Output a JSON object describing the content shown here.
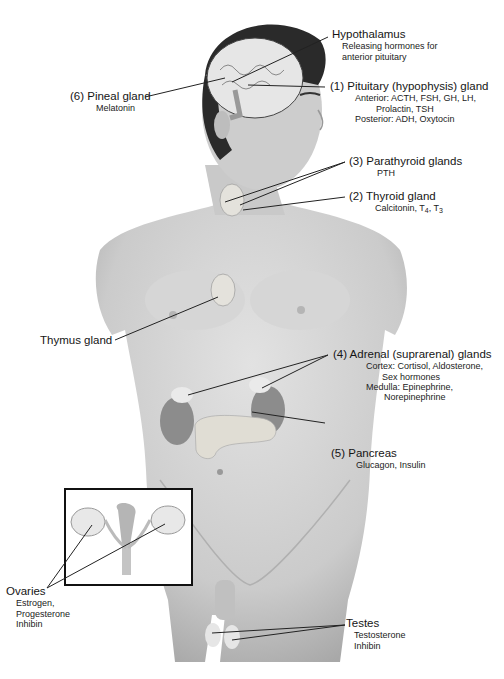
{
  "figure": {
    "labels": {
      "hypothalamus": {
        "name": "Hypothalamus",
        "hormones": [
          "Releasing hormones for",
          "anterior pituitary"
        ]
      },
      "pituitary": {
        "name": "(1) Pituitary (hypophysis) gland",
        "hormones": [
          "Anterior: ACTH, FSH, GH, LH,",
          "Prolactin, TSH",
          "Posterior: ADH, Oxytocin"
        ]
      },
      "pineal": {
        "name": "(6) Pineal gland",
        "hormones": [
          "Melatonin"
        ]
      },
      "parathyroid": {
        "name": "(3) Parathyroid glands",
        "hormones": [
          "PTH"
        ]
      },
      "thyroid": {
        "name": "(2) Thyroid gland",
        "hormones_prefix": "Calcitonin, T",
        "t4_sub": "4",
        "sep": ", T",
        "t3_sub": "3"
      },
      "thymus": {
        "name": "Thymus gland"
      },
      "adrenal": {
        "name": "(4) Adrenal (suprarenal) glands",
        "hormones": [
          "Cortex: Cortisol, Aldosterone,",
          "Sex hormones",
          "Medulla: Epinephrine,",
          "Norepinephrine"
        ]
      },
      "pancreas": {
        "name": "(5) Pancreas",
        "hormones": [
          "Glucagon, Insulin"
        ]
      },
      "ovaries": {
        "name": "Ovaries",
        "hormones": [
          "Estrogen,",
          "Progesterone",
          "Inhibin"
        ]
      },
      "testes": {
        "name": "Testes",
        "hormones": [
          "Testosterone",
          "Inhibin"
        ]
      }
    },
    "colors": {
      "skin": "#cfcfcf",
      "skin_shadow": "#a9a9a9",
      "hair": "#2a2a2a",
      "gland": "#e8e6e0",
      "kidney": "#8a8a8a",
      "line": "#222222"
    }
  }
}
